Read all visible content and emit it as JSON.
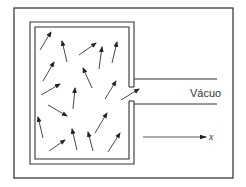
{
  "diagram": {
    "labels": {
      "vacuum": "Vácuo",
      "axis": "x"
    },
    "colors": {
      "stroke": "#333333",
      "background": "#ffffff"
    },
    "frame": {
      "x": 14,
      "y": 8,
      "width": 219,
      "height": 170
    },
    "container": {
      "outer": {
        "x": 30,
        "y": 22,
        "width": 104,
        "height": 142
      },
      "inner": {
        "x": 35,
        "y": 27,
        "width": 94,
        "height": 132
      },
      "orifice": {
        "y_top": 87,
        "y_bottom": 101
      }
    },
    "tube": {
      "x_start": 134,
      "x_end": 217,
      "y_top": 79,
      "y_bottom": 104
    },
    "axis_arrow": {
      "x1": 143,
      "y1": 137,
      "x2": 206,
      "y2": 137
    },
    "molecules": [
      {
        "x1": 40,
        "y1": 50,
        "x2": 51,
        "y2": 32
      },
      {
        "x1": 67,
        "y1": 62,
        "x2": 62,
        "y2": 41
      },
      {
        "x1": 79,
        "y1": 55,
        "x2": 96,
        "y2": 43
      },
      {
        "x1": 99,
        "y1": 69,
        "x2": 102,
        "y2": 47
      },
      {
        "x1": 112,
        "y1": 63,
        "x2": 117,
        "y2": 42
      },
      {
        "x1": 43,
        "y1": 81,
        "x2": 54,
        "y2": 62
      },
      {
        "x1": 92,
        "y1": 88,
        "x2": 83,
        "y2": 68
      },
      {
        "x1": 41,
        "y1": 95,
        "x2": 60,
        "y2": 84
      },
      {
        "x1": 73,
        "y1": 109,
        "x2": 75,
        "y2": 88
      },
      {
        "x1": 105,
        "y1": 99,
        "x2": 116,
        "y2": 81
      },
      {
        "x1": 121,
        "y1": 100,
        "x2": 139,
        "y2": 89
      },
      {
        "x1": 48,
        "y1": 105,
        "x2": 67,
        "y2": 116
      },
      {
        "x1": 43,
        "y1": 138,
        "x2": 38,
        "y2": 117
      },
      {
        "x1": 49,
        "y1": 151,
        "x2": 65,
        "y2": 140
      },
      {
        "x1": 77,
        "y1": 150,
        "x2": 72,
        "y2": 129
      },
      {
        "x1": 95,
        "y1": 133,
        "x2": 107,
        "y2": 113
      },
      {
        "x1": 93,
        "y1": 151,
        "x2": 88,
        "y2": 132
      },
      {
        "x1": 108,
        "y1": 152,
        "x2": 120,
        "y2": 133
      }
    ]
  }
}
